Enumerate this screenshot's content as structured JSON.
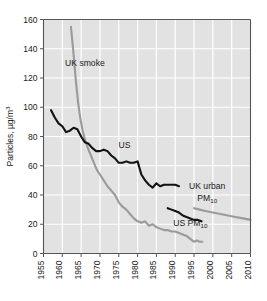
{
  "chart_data": {
    "type": "line",
    "title": "",
    "xlabel": "",
    "ylabel": "Particles, µg/m³",
    "ylabel_main": "Particles, µg/m",
    "ylabel_sup": "3",
    "xlim": [
      1955,
      2010
    ],
    "ylim": [
      0,
      160
    ],
    "grid": true,
    "legend_position": "inline-annotations",
    "xticks": [
      1955,
      1960,
      1965,
      1970,
      1975,
      1980,
      1985,
      1990,
      1995,
      2000,
      2005,
      2010
    ],
    "xticklabels": [
      "1955",
      "1960",
      "1965",
      "1970",
      "1975",
      "1980",
      "1985",
      "1990",
      "1995",
      "2000",
      "2005",
      "2010"
    ],
    "yticks": [
      0,
      20,
      40,
      60,
      80,
      100,
      120,
      140,
      160
    ],
    "yticklabels": [
      "0",
      "20",
      "40",
      "60",
      "80",
      "100",
      "120",
      "140",
      "160"
    ],
    "colors": {
      "dark_series": "#121212",
      "gray_series": "#9a9a9a",
      "plot_background": "#e2e2e2",
      "gridline": "#ffffff",
      "axis": "#555555"
    },
    "annotations": [
      {
        "name": "uk-smoke-label",
        "text": "UK smoke",
        "x": 1966.0,
        "y": 128
      },
      {
        "name": "us-label",
        "text": "US",
        "x": 1976.5,
        "y": 72
      },
      {
        "name": "uk-urban-pm10-label-line1",
        "text": "UK urban",
        "x": 1998.5,
        "y": 44
      },
      {
        "name": "uk-urban-pm10-label-line2",
        "text": "PM",
        "subscript": "10",
        "x": 1998.5,
        "y": 36
      },
      {
        "name": "us-pm10-label",
        "text": "US PM",
        "subscript": "10",
        "x": 1994.0,
        "y": 19
      }
    ],
    "series": [
      {
        "name": "UK smoke",
        "color": "#9a9a9a",
        "points": [
          [
            1962.3,
            155
          ],
          [
            1963.0,
            136
          ],
          [
            1963.6,
            118
          ],
          [
            1964.2,
            103
          ],
          [
            1964.8,
            92
          ],
          [
            1965.4,
            84
          ],
          [
            1966.0,
            78
          ],
          [
            1966.8,
            72
          ],
          [
            1967.6,
            67
          ],
          [
            1968.4,
            62
          ],
          [
            1969.2,
            57
          ],
          [
            1970.0,
            54
          ],
          [
            1971.0,
            50
          ],
          [
            1972.0,
            46
          ],
          [
            1973.0,
            43
          ],
          [
            1974.0,
            40
          ],
          [
            1975.0,
            35
          ],
          [
            1976.0,
            32
          ],
          [
            1977.0,
            30
          ],
          [
            1978.0,
            27
          ],
          [
            1979.0,
            24
          ],
          [
            1980.0,
            22
          ],
          [
            1981.0,
            21
          ],
          [
            1982.0,
            22
          ],
          [
            1983.0,
            19
          ],
          [
            1984.0,
            20
          ],
          [
            1985.0,
            18
          ],
          [
            1986.0,
            17
          ],
          [
            1987.0,
            16
          ],
          [
            1988.0,
            16
          ],
          [
            1989.0,
            15
          ],
          [
            1990.0,
            15
          ],
          [
            1991.0,
            14
          ],
          [
            1992.0,
            13
          ],
          [
            1993.0,
            12
          ],
          [
            1994.0,
            10
          ],
          [
            1995.0,
            8
          ],
          [
            1995.8,
            9
          ],
          [
            1996.5,
            8
          ],
          [
            1997.2,
            8
          ]
        ]
      },
      {
        "name": "US",
        "color": "#121212",
        "points": [
          [
            1957.0,
            98
          ],
          [
            1958.0,
            93
          ],
          [
            1959.0,
            89
          ],
          [
            1960.0,
            87
          ],
          [
            1961.0,
            83
          ],
          [
            1962.0,
            84
          ],
          [
            1963.0,
            86
          ],
          [
            1964.0,
            85
          ],
          [
            1965.0,
            80
          ],
          [
            1966.0,
            76
          ],
          [
            1967.0,
            75
          ],
          [
            1968.0,
            72
          ],
          [
            1969.0,
            70
          ],
          [
            1970.0,
            70
          ],
          [
            1971.0,
            71
          ],
          [
            1972.0,
            70
          ],
          [
            1973.0,
            67
          ],
          [
            1974.0,
            65
          ],
          [
            1975.0,
            62
          ],
          [
            1976.0,
            62
          ],
          [
            1977.0,
            63
          ],
          [
            1978.0,
            62
          ],
          [
            1979.0,
            62
          ],
          [
            1980.0,
            63
          ],
          [
            1981.0,
            54
          ],
          [
            1982.0,
            50
          ],
          [
            1983.0,
            47
          ],
          [
            1984.0,
            45
          ],
          [
            1985.0,
            48
          ],
          [
            1986.0,
            46
          ],
          [
            1987.0,
            47
          ],
          [
            1988.0,
            47
          ],
          [
            1989.0,
            47
          ],
          [
            1990.0,
            47
          ],
          [
            1991.0,
            46
          ]
        ]
      },
      {
        "name": "US PM10",
        "color": "#121212",
        "points": [
          [
            1988.0,
            31
          ],
          [
            1989.0,
            30
          ],
          [
            1990.0,
            29
          ],
          [
            1991.0,
            28
          ],
          [
            1992.0,
            26
          ],
          [
            1993.0,
            25
          ],
          [
            1994.0,
            24
          ],
          [
            1995.0,
            23
          ],
          [
            1996.0,
            23
          ],
          [
            1997.0,
            22
          ]
        ]
      },
      {
        "name": "UK urban PM10",
        "color": "#9a9a9a",
        "points": [
          [
            1995.0,
            31
          ],
          [
            1996.5,
            30
          ],
          [
            1998.0,
            29
          ],
          [
            2000.0,
            28
          ],
          [
            2002.0,
            27
          ],
          [
            2004.0,
            26
          ],
          [
            2006.0,
            25
          ],
          [
            2008.0,
            24
          ],
          [
            2010.0,
            23
          ]
        ]
      }
    ]
  }
}
